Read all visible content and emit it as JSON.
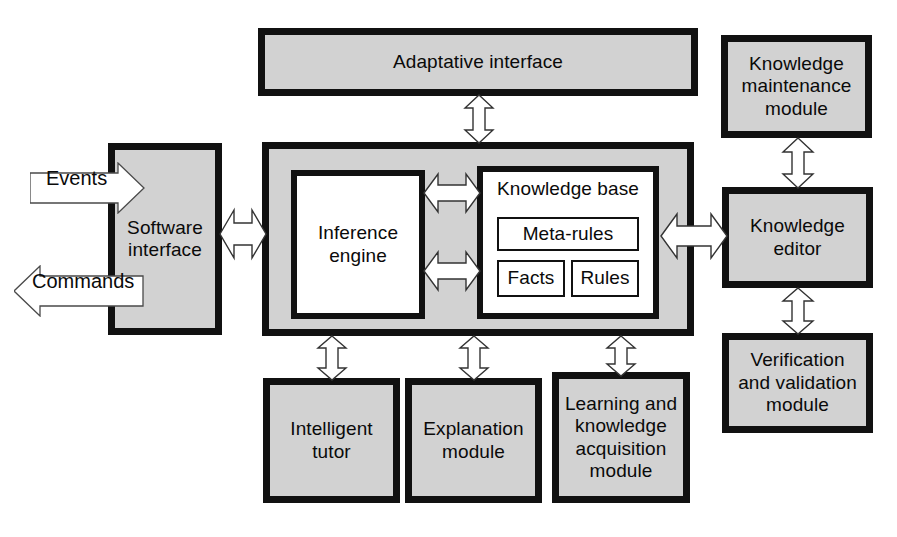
{
  "diagram": {
    "colors": {
      "box_fill": "#d2d2d2",
      "box_fill_white": "#ffffff",
      "box_border": "#111111",
      "arrow_fill": "#ffffff",
      "arrow_stroke": "#222222",
      "background": "#ffffff",
      "text": "#0a0a0a"
    }
  },
  "nodes": {
    "adaptive_interface": {
      "label": "Adaptative interface"
    },
    "software_interface": {
      "label": "Software\ninterface"
    },
    "inference_engine": {
      "label": "Inference\nengine"
    },
    "knowledge_base": {
      "title": "Knowledge base",
      "meta_rules": {
        "label": "Meta-rules"
      },
      "facts": {
        "label": "Facts"
      },
      "rules": {
        "label": "Rules"
      }
    },
    "intelligent_tutor": {
      "label": "Intelligent\ntutor"
    },
    "explanation_module": {
      "label": "Explanation\nmodule"
    },
    "learning_module": {
      "label": "Learning and\nknowledge\nacquisition\nmodule"
    },
    "knowledge_maintenance_module": {
      "label": "Knowledge\nmaintenance\nmodule"
    },
    "knowledge_editor": {
      "label": "Knowledge\neditor"
    },
    "verification_module": {
      "label": "Verification\nand validation\nmodule"
    }
  },
  "io": {
    "events": {
      "label": "Events",
      "direction": "right"
    },
    "commands": {
      "label": "Commands",
      "direction": "left"
    }
  },
  "connectors": [
    {
      "name": "adaptive-interface-to-core",
      "orientation": "vertical",
      "heads": "both"
    },
    {
      "name": "software-interface-to-core",
      "orientation": "horizontal",
      "heads": "both"
    },
    {
      "name": "inference-engine-to-knowledge-base-upper",
      "orientation": "horizontal",
      "heads": "both"
    },
    {
      "name": "inference-engine-to-knowledge-base-lower",
      "orientation": "horizontal",
      "heads": "both"
    },
    {
      "name": "core-to-knowledge-editor",
      "orientation": "horizontal",
      "heads": "both"
    },
    {
      "name": "core-to-intelligent-tutor",
      "orientation": "vertical",
      "heads": "both"
    },
    {
      "name": "core-to-explanation-module",
      "orientation": "vertical",
      "heads": "both"
    },
    {
      "name": "core-to-learning-module",
      "orientation": "vertical",
      "heads": "both"
    },
    {
      "name": "knowledge-maintenance-to-editor",
      "orientation": "vertical",
      "heads": "both"
    },
    {
      "name": "knowledge-editor-to-verification",
      "orientation": "vertical",
      "heads": "both"
    }
  ]
}
